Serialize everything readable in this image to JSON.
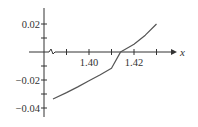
{
  "chart_data": {
    "type": "line",
    "title": "",
    "xlabel": "x",
    "ylabel": "",
    "xlim": [
      1.3836,
      1.4336
    ],
    "ylim": [
      -0.045,
      0.025
    ],
    "grid": false,
    "legend": null,
    "x_axis_break": true,
    "x_ticks": [
      1.39,
      1.4,
      1.41,
      1.42,
      1.43
    ],
    "x_tick_labels": [
      {
        "value": 1.4,
        "label": "1.40"
      },
      {
        "value": 1.42,
        "label": "1.42"
      }
    ],
    "y_ticks": [
      0.02,
      0.01,
      0,
      -0.01,
      -0.02,
      -0.03,
      -0.04
    ],
    "y_tick_labels": [
      {
        "value": 0.02,
        "label": "0.02"
      },
      {
        "value": -0.02,
        "label": "−0.02"
      },
      {
        "value": -0.04,
        "label": "−0.04"
      }
    ],
    "series": [
      {
        "name": "curve",
        "color": "#555555",
        "x": [
          1.384,
          1.39,
          1.395,
          1.4,
          1.405,
          1.41,
          1.414,
          1.42,
          1.425,
          1.43
        ],
        "y": [
          -0.0336,
          -0.029,
          -0.0249,
          -0.0206,
          -0.0162,
          -0.0116,
          -0.0001,
          0.0055,
          0.012,
          0.02
        ]
      }
    ],
    "annotations": [
      {
        "text": "x",
        "position": "right end of x-axis"
      }
    ]
  },
  "colors": {
    "axis": "#333333",
    "curve": "#555555",
    "background": "#ffffff"
  }
}
